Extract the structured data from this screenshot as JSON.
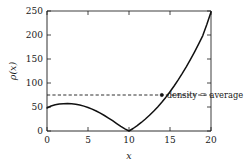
{
  "chart_data": {
    "type": "line",
    "title": "",
    "xlabel": "x",
    "ylabel": "ρ(x)",
    "xlim": [
      0,
      20
    ],
    "ylim": [
      0,
      250
    ],
    "xticks": [
      0,
      5,
      10,
      15,
      20
    ],
    "xticklabels": [
      "0",
      "5",
      "10",
      "15",
      "20"
    ],
    "yticks": [
      0,
      50,
      100,
      150,
      200,
      250
    ],
    "yticklabels": [
      "0",
      "50",
      "100",
      "150",
      "200",
      "250"
    ],
    "grid": false,
    "legend": "none",
    "series": [
      {
        "name": "ρ(x)",
        "style": "solid",
        "color": "#111111",
        "x": [
          0,
          0.5,
          1,
          1.5,
          2,
          2.5,
          3,
          3.5,
          4,
          4.5,
          5,
          5.5,
          6,
          6.5,
          7,
          7.5,
          8,
          8.5,
          9,
          9.5,
          10,
          10.5,
          11,
          11.5,
          12,
          12.5,
          13,
          13.5,
          14,
          14.5,
          15,
          15.5,
          16,
          16.5,
          17,
          17.5,
          18,
          18.5,
          19,
          19.5,
          20
        ],
        "values": [
          48,
          52,
          54.5,
          56.3,
          57,
          57.2,
          56.8,
          55.7,
          54,
          51.8,
          49,
          45.6,
          41.6,
          37.2,
          32.3,
          27,
          21.4,
          15.5,
          9.6,
          4.3,
          0,
          5.2,
          11.2,
          17.8,
          25,
          32.8,
          41.2,
          50.2,
          60,
          70.5,
          81.8,
          93.8,
          106.5,
          120,
          134.2,
          149.2,
          165,
          181.5,
          198.8,
          222.5,
          248
        ]
      },
      {
        "name": "average density",
        "style": "dashed",
        "color": "#1a1a1a",
        "x": [
          0,
          20
        ],
        "values": [
          75,
          75
        ]
      }
    ],
    "markers": [
      {
        "name": "intersection-point",
        "x": 14,
        "y": 75
      }
    ],
    "annotations": [
      {
        "name": "density-average-label",
        "text": "density = average",
        "x": 14.6,
        "y": 68
      }
    ]
  }
}
